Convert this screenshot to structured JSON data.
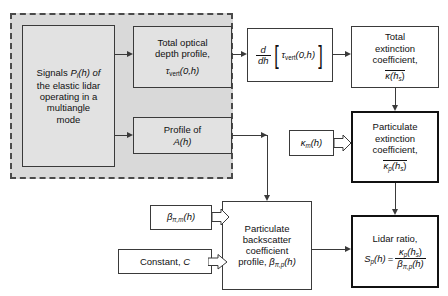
{
  "diagram": {
    "group_label": "multiangle-measurement-group",
    "nodes": {
      "signals": {
        "l1": "Signals",
        "sym": "P",
        "subi": "i",
        "arg": "(h) of",
        "l2": "the elastic lidar",
        "l3": "operating in a",
        "l4": "multiangle",
        "l5": "mode"
      },
      "tau": {
        "l1": "Total optical",
        "l2": "depth profile,",
        "sym": "τ",
        "sub": "vert",
        "arg": "(0,h)"
      },
      "a_profile": {
        "l1": "Profile of",
        "sym": "A",
        "arg": "(h)"
      },
      "derivative": {
        "num": "d",
        "den": "dh",
        "open": "[",
        "sym": "τ",
        "sub": "vert",
        "arg": "(0,h)",
        "close": "]"
      },
      "kappa_total": {
        "l1": "Total",
        "l2": "extinction",
        "l3": "coefficient,",
        "sym": "κ",
        "arg": "(h",
        "sub": "s",
        "argend": ")"
      },
      "kappa_m": {
        "sym": "κ",
        "sub": "m",
        "arg": "(h)"
      },
      "kappa_p": {
        "l1": "Particulate",
        "l2": "extinction",
        "l3": "coefficient,",
        "sym": "κ",
        "sub": "p",
        "arg": "(h",
        "sub2": "s",
        "argend": ")"
      },
      "beta_m": {
        "sym": "β",
        "sub": "π,m",
        "arg": "(h)"
      },
      "constant": {
        "text": "Constant,",
        "sym": "C"
      },
      "backscatter": {
        "l1": "Particulate",
        "l2": "backscatter",
        "l3": "coefficient",
        "l4": "profile,",
        "sym": "β",
        "sub": "π,p",
        "arg": "(h)"
      },
      "lidar_ratio": {
        "l1": "Lidar ratio,",
        "lhs": "S",
        "lhssub": "p",
        "lhsarg": "(h)",
        "eq": "=",
        "numsym": "κ",
        "numsub": "p",
        "numarg": "(h",
        "numsub2": "s",
        "numargend": ")",
        "densym": "β",
        "densub": "π,p",
        "denarg": "(h)"
      }
    },
    "edges": [
      {
        "from": "signals",
        "to": "tau",
        "style": "line-arrow"
      },
      {
        "from": "signals",
        "to": "a_profile",
        "style": "line-arrow"
      },
      {
        "from": "tau",
        "to": "derivative",
        "style": "line-arrow"
      },
      {
        "from": "derivative",
        "to": "kappa_total",
        "style": "line-arrow"
      },
      {
        "from": "kappa_total",
        "to": "kappa_p",
        "style": "line-arrow"
      },
      {
        "from": "kappa_m",
        "to": "kappa_p",
        "style": "block-arrow"
      },
      {
        "from": "a_profile",
        "to": "backscatter",
        "style": "line-arrow"
      },
      {
        "from": "beta_m",
        "to": "backscatter",
        "style": "block-arrow"
      },
      {
        "from": "constant",
        "to": "backscatter",
        "style": "block-arrow"
      },
      {
        "from": "kappa_p",
        "to": "lidar_ratio",
        "style": "line-arrow"
      },
      {
        "from": "backscatter",
        "to": "lidar_ratio",
        "style": "line-arrow"
      }
    ],
    "colors": {
      "group_fill": "#d9d9d9",
      "group_border": "#4a4a4a",
      "box_fill": "#ffffff",
      "shaded_fill": "#e2e2e2",
      "stroke": "#3a3a3a",
      "emphasis_stroke": "#111111",
      "text": "#111111"
    }
  }
}
